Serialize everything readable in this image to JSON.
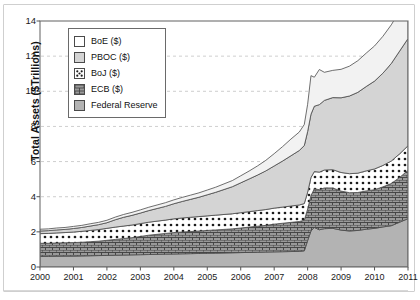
{
  "figure": {
    "frame_visible": true,
    "background": "#ffffff"
  },
  "chart_data": {
    "type": "area",
    "stacked": true,
    "title": "",
    "subtitle": "",
    "xlabel": "",
    "ylabel": "Total Assets ($Trillions)",
    "xlim": [
      2000,
      2011
    ],
    "ylim": [
      0,
      14
    ],
    "ytick_labels": [
      "0",
      "2",
      "4",
      "6",
      "8",
      "10",
      "12",
      "14"
    ],
    "ytick_values": [
      0,
      2,
      4,
      6,
      8,
      10,
      12,
      14
    ],
    "xtick_labels": [
      "2000",
      "2001",
      "2002",
      "2003",
      "2004",
      "2005",
      "2006",
      "2007",
      "2008",
      "2009",
      "2010",
      "2011"
    ],
    "xtick_values": [
      2000,
      2001,
      2002,
      2003,
      2004,
      2005,
      2006,
      2007,
      2008,
      2009,
      2010,
      2011
    ],
    "grid": "horizontal-dashed",
    "legend_position": "upper-left-inside",
    "legend_order_top_to_bottom": [
      "BoE ($)",
      "PBOC ($)",
      "BoJ ($)",
      "ECB ($)",
      "Federal Reserve"
    ],
    "stack_order_bottom_to_top": [
      "Federal Reserve",
      "ECB ($)",
      "BoJ ($)",
      "PBOC ($)",
      "BoE ($)"
    ],
    "x": [
      2000.0,
      2000.25,
      2000.5,
      2000.75,
      2001.0,
      2001.25,
      2001.5,
      2001.75,
      2002.0,
      2002.25,
      2002.5,
      2002.75,
      2003.0,
      2003.25,
      2003.5,
      2003.75,
      2004.0,
      2004.25,
      2004.5,
      2004.75,
      2005.0,
      2005.25,
      2005.5,
      2005.75,
      2006.0,
      2006.25,
      2006.5,
      2006.75,
      2007.0,
      2007.25,
      2007.5,
      2007.75,
      2007.9,
      2008.0,
      2008.1,
      2008.2,
      2008.35,
      2008.5,
      2008.75,
      2009.0,
      2009.25,
      2009.5,
      2009.75,
      2010.0,
      2010.25,
      2010.5,
      2010.75,
      2011.0
    ],
    "series": [
      {
        "name": "Federal Reserve",
        "color": "#b3b3b3",
        "pattern": "solid-gray",
        "values": [
          0.6,
          0.6,
          0.61,
          0.62,
          0.62,
          0.63,
          0.64,
          0.65,
          0.66,
          0.67,
          0.68,
          0.69,
          0.7,
          0.71,
          0.72,
          0.73,
          0.74,
          0.75,
          0.76,
          0.77,
          0.78,
          0.79,
          0.8,
          0.81,
          0.82,
          0.83,
          0.84,
          0.85,
          0.86,
          0.87,
          0.88,
          0.89,
          0.92,
          1.5,
          2.05,
          2.25,
          2.12,
          2.18,
          2.2,
          2.1,
          2.05,
          2.08,
          2.15,
          2.2,
          2.28,
          2.35,
          2.55,
          2.75
        ]
      },
      {
        "name": "ECB ($)",
        "color": "#8e8e8e",
        "pattern": "crosshatch-brick",
        "values": [
          0.75,
          0.75,
          0.76,
          0.76,
          0.77,
          0.78,
          0.8,
          0.82,
          0.86,
          0.9,
          0.94,
          0.98,
          1.04,
          1.1,
          1.14,
          1.18,
          1.22,
          1.24,
          1.26,
          1.28,
          1.3,
          1.32,
          1.34,
          1.36,
          1.4,
          1.44,
          1.48,
          1.52,
          1.58,
          1.62,
          1.66,
          1.7,
          1.74,
          1.8,
          2.02,
          2.2,
          2.28,
          2.32,
          2.3,
          2.22,
          2.18,
          2.16,
          2.18,
          2.2,
          2.28,
          2.4,
          2.55,
          2.75
        ]
      },
      {
        "name": "BoJ ($)",
        "color": "#ffffff",
        "pattern": "dotted-white",
        "values": [
          0.55,
          0.56,
          0.57,
          0.58,
          0.6,
          0.62,
          0.64,
          0.66,
          0.68,
          0.7,
          0.71,
          0.72,
          0.73,
          0.74,
          0.75,
          0.76,
          0.78,
          0.8,
          0.81,
          0.82,
          0.83,
          0.84,
          0.85,
          0.86,
          0.87,
          0.88,
          0.89,
          0.9,
          0.91,
          0.92,
          0.93,
          0.94,
          0.95,
          0.96,
          1.02,
          0.98,
          1.0,
          1.02,
          1.04,
          1.06,
          1.08,
          1.1,
          1.14,
          1.18,
          1.22,
          1.28,
          1.34,
          1.4
        ]
      },
      {
        "name": "PBOC ($)",
        "color": "#d4d4d4",
        "pattern": "light-gray",
        "values": [
          0.15,
          0.16,
          0.17,
          0.18,
          0.2,
          0.22,
          0.25,
          0.28,
          0.32,
          0.42,
          0.5,
          0.55,
          0.6,
          0.66,
          0.72,
          0.78,
          0.86,
          0.94,
          1.02,
          1.1,
          1.2,
          1.3,
          1.42,
          1.54,
          1.7,
          1.86,
          2.02,
          2.2,
          2.4,
          2.62,
          2.86,
          3.1,
          3.3,
          3.45,
          3.6,
          3.72,
          3.84,
          3.96,
          4.1,
          4.25,
          4.42,
          4.6,
          4.8,
          5.0,
          5.25,
          5.55,
          5.85,
          6.1
        ]
      },
      {
        "name": "BoE ($)",
        "color": "#f2f2f2",
        "pattern": "white",
        "values": [
          0.1,
          0.1,
          0.11,
          0.11,
          0.12,
          0.12,
          0.13,
          0.13,
          0.14,
          0.15,
          0.16,
          0.17,
          0.18,
          0.19,
          0.2,
          0.21,
          0.22,
          0.23,
          0.24,
          0.25,
          0.27,
          0.29,
          0.32,
          0.35,
          0.4,
          0.45,
          0.52,
          0.6,
          0.7,
          0.82,
          0.95,
          1.05,
          1.2,
          1.55,
          2.2,
          1.65,
          2.0,
          1.6,
          1.55,
          1.62,
          1.7,
          1.8,
          1.9,
          2.0,
          2.1,
          2.2,
          2.28,
          2.35
        ]
      }
    ],
    "totals": {
      "2000": 2.15,
      "2008_peak": 10.25,
      "2011": 15.35
    }
  },
  "legend": {
    "items": [
      {
        "label": "BoE ($)",
        "swatch": "boe-swatch",
        "pattern": "white"
      },
      {
        "label": "PBOC ($)",
        "swatch": "pboc-swatch",
        "pattern": "light-gray"
      },
      {
        "label": "BoJ ($)",
        "swatch": "boj-swatch",
        "pattern": "dotted"
      },
      {
        "label": "ECB ($)",
        "swatch": "ecb-swatch",
        "pattern": "crosshatch"
      },
      {
        "label": "Federal Reserve",
        "swatch": "fed-swatch",
        "pattern": "gray"
      }
    ]
  },
  "colors": {
    "boe": "#f2f2f2",
    "pboc": "#d4d4d4",
    "boj": "#ffffff",
    "ecb": "#8e8e8e",
    "fed": "#b3b3b3",
    "axis": "#555555",
    "grid": "#bdbdbd",
    "text": "#111111"
  }
}
